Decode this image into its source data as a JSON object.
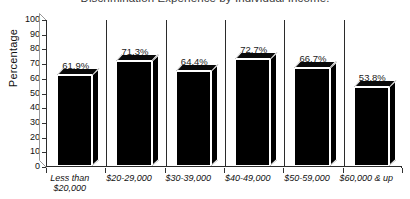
{
  "chart_data": {
    "type": "bar",
    "title": "Discrimination Experience by Individual Income.",
    "xlabel": "",
    "ylabel": "Percentage",
    "ylim": [
      0,
      100
    ],
    "ytick_step": 10,
    "yticks": [
      "100",
      "90",
      "80",
      "70",
      "60",
      "50",
      "40",
      "30",
      "20",
      "10",
      "0"
    ],
    "grid": false,
    "legend": "none",
    "style": "3d-black-bars",
    "categories": [
      "Less than\n$20,000",
      "$20-29,000",
      "$30-39,000",
      "$40-49,000",
      "$50-59,000",
      "$60,000 & up"
    ],
    "values": [
      61.9,
      71.3,
      64.4,
      72.7,
      66.7,
      53.8
    ],
    "data_labels": [
      "61.9%",
      "71.3%",
      "64.4%",
      "72.7%",
      "66.7%",
      "53.8%"
    ]
  },
  "colors": {
    "bar_fill": "#000000",
    "bar_outline": "#ffffff",
    "axis": "#2b2b2b",
    "text": "#111111",
    "title": "#3a3a3a",
    "background": "#ffffff"
  }
}
